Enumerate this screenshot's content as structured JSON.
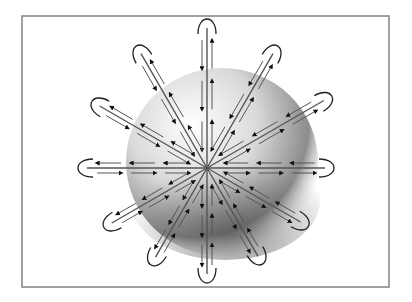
{
  "figure": {
    "title": "",
    "frame": {
      "x": 22,
      "y": 16,
      "width": 367,
      "height": 271,
      "stroke": "#8a8a8a"
    },
    "center": {
      "x": 207,
      "y": 168
    },
    "sphere": {
      "cx": 222,
      "cy": 158,
      "r": 92,
      "highlight": "#ffffff",
      "shadow": "#2e2e2e"
    },
    "colors": {
      "line": "#555555",
      "arrow": "#111111",
      "loop": "#222222"
    },
    "spokes": [
      {
        "angle_deg": 90,
        "length": 140
      },
      {
        "angle_deg": 60,
        "length": 132
      },
      {
        "angle_deg": 30,
        "length": 135
      },
      {
        "angle_deg": 0,
        "length": 118
      },
      {
        "angle_deg": -30,
        "length": 108
      },
      {
        "angle_deg": -60,
        "length": 102
      },
      {
        "angle_deg": -90,
        "length": 106
      },
      {
        "angle_deg": -120,
        "length": 103
      },
      {
        "angle_deg": -150,
        "length": 110
      },
      {
        "angle_deg": 180,
        "length": 120
      },
      {
        "angle_deg": 150,
        "length": 124
      },
      {
        "angle_deg": 120,
        "length": 132
      }
    ]
  }
}
